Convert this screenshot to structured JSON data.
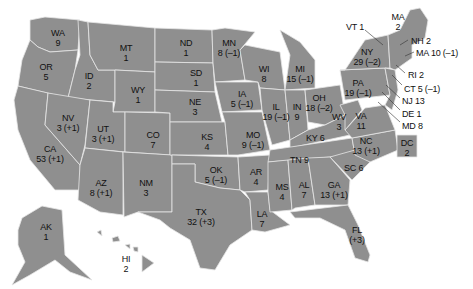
{
  "map": {
    "title": "",
    "fill_color": "#8f8f8f",
    "border_color": "#e6e6e6",
    "states": [
      {
        "abbr": "WA",
        "value": "9"
      },
      {
        "abbr": "OR",
        "value": "5"
      },
      {
        "abbr": "CA",
        "value": "53 (+1)"
      },
      {
        "abbr": "ID",
        "value": "2"
      },
      {
        "abbr": "NV",
        "value": "3 (+1)"
      },
      {
        "abbr": "MT",
        "value": "1"
      },
      {
        "abbr": "WY",
        "value": "1"
      },
      {
        "abbr": "UT",
        "value": "3 (+1)"
      },
      {
        "abbr": "AZ",
        "value": "8 (+1)"
      },
      {
        "abbr": "CO",
        "value": "7"
      },
      {
        "abbr": "NM",
        "value": "3"
      },
      {
        "abbr": "ND",
        "value": "1"
      },
      {
        "abbr": "SD",
        "value": "1"
      },
      {
        "abbr": "NE",
        "value": "3"
      },
      {
        "abbr": "KS",
        "value": "4"
      },
      {
        "abbr": "OK",
        "value": "5 (–1)"
      },
      {
        "abbr": "TX",
        "value": "32 (+3)"
      },
      {
        "abbr": "MN",
        "value": "8 (–1)"
      },
      {
        "abbr": "IA",
        "value": "5 (–1)"
      },
      {
        "abbr": "MO",
        "value": "9 (–1)"
      },
      {
        "abbr": "AR",
        "value": "4"
      },
      {
        "abbr": "LA",
        "value": "7"
      },
      {
        "abbr": "WI",
        "value": "8"
      },
      {
        "abbr": "IL",
        "value": "19 (–1)"
      },
      {
        "abbr": "MI",
        "value": "15 (–1)"
      },
      {
        "abbr": "IN",
        "value": "9"
      },
      {
        "abbr": "OH",
        "value": "18 (–2)"
      },
      {
        "abbr": "KY",
        "value": "6"
      },
      {
        "abbr": "TN",
        "value": "9"
      },
      {
        "abbr": "MS",
        "value": "4"
      },
      {
        "abbr": "AL",
        "value": "7"
      },
      {
        "abbr": "GA",
        "value": "13 (+1)"
      },
      {
        "abbr": "FL",
        "value": "(+3)"
      },
      {
        "abbr": "SC",
        "value": "6"
      },
      {
        "abbr": "NC",
        "value": "13 (+1)"
      },
      {
        "abbr": "VA",
        "value": "11"
      },
      {
        "abbr": "WV",
        "value": "3"
      },
      {
        "abbr": "PA",
        "value": "19 (–1)"
      },
      {
        "abbr": "NY",
        "value": "29 (–2)"
      },
      {
        "abbr": "ME",
        "value": "2"
      },
      {
        "abbr": "AK",
        "value": "1"
      },
      {
        "abbr": "HI",
        "value": "2"
      },
      {
        "abbr": "DC",
        "value": "2"
      }
    ],
    "callouts": [
      {
        "label": "VT 1"
      },
      {
        "label": "NH 2"
      },
      {
        "label": "MA 10 (–1)"
      },
      {
        "label": "RI 2"
      },
      {
        "label": "CT 5 (–1)"
      },
      {
        "label": "NJ 13"
      },
      {
        "label": "DE 1"
      },
      {
        "label": "MD 8"
      }
    ],
    "me_abbr_shown": "MA"
  }
}
